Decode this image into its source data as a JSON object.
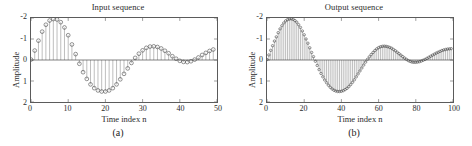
{
  "figure": {
    "background": "#ffffff",
    "line_color": "#7a7a7a",
    "marker_color": "#3a3a3a",
    "axis_color": "#5b5b5b"
  },
  "panels": [
    {
      "id": "a",
      "sublabel": "(a)",
      "title": "Input sequence",
      "xlabel": "Time index n",
      "ylabel": "Amplitude",
      "xticks": [
        "0",
        "10",
        "20",
        "30",
        "40",
        "50"
      ],
      "yticks": [
        "2",
        "1",
        "0",
        "-1",
        "-2"
      ]
    },
    {
      "id": "b",
      "sublabel": "(b)",
      "title": "Output sequence",
      "xlabel": "Time index n",
      "ylabel": "Amplitude",
      "xticks": [
        "0",
        "20",
        "40",
        "60",
        "80",
        "100"
      ],
      "yticks": [
        "2",
        "1",
        "0",
        "-1",
        "-2"
      ]
    }
  ],
  "chart_data": [
    {
      "type": "bar",
      "plot_style": "stem",
      "title": "Input sequence",
      "xlabel": "Time index n",
      "ylabel": "Amplitude",
      "xlim": [
        0,
        50
      ],
      "ylim": [
        -2,
        2
      ],
      "xticks": [
        0,
        10,
        20,
        30,
        40,
        50
      ],
      "yticks": [
        -2,
        -1,
        0,
        1,
        2
      ],
      "grid": false,
      "legend": null,
      "marker": "open-circle",
      "x": [
        0,
        1,
        2,
        3,
        4,
        5,
        6,
        7,
        8,
        9,
        10,
        11,
        12,
        13,
        14,
        15,
        16,
        17,
        18,
        19,
        20,
        21,
        22,
        23,
        24,
        25,
        26,
        27,
        28,
        29,
        30,
        31,
        32,
        33,
        34,
        35,
        36,
        37,
        38,
        39,
        40,
        41,
        42,
        43,
        44,
        45,
        46,
        47,
        48,
        49
      ],
      "values": [
        0.02,
        0.45,
        0.92,
        1.35,
        1.68,
        1.88,
        1.95,
        1.93,
        1.8,
        1.55,
        1.18,
        0.74,
        0.28,
        -0.18,
        -0.58,
        -0.9,
        -1.16,
        -1.34,
        -1.45,
        -1.5,
        -1.5,
        -1.45,
        -1.34,
        -1.16,
        -0.92,
        -0.66,
        -0.4,
        -0.14,
        0.1,
        0.3,
        0.46,
        0.58,
        0.64,
        0.65,
        0.62,
        0.55,
        0.44,
        0.32,
        0.18,
        0.06,
        -0.04,
        -0.09,
        -0.1,
        -0.06,
        0.02,
        0.12,
        0.24,
        0.34,
        0.43,
        0.5
      ]
    },
    {
      "type": "bar",
      "plot_style": "stem",
      "title": "Output sequence",
      "xlabel": "Time index n",
      "ylabel": "Amplitude",
      "xlim": [
        0,
        100
      ],
      "ylim": [
        -2,
        2
      ],
      "xticks": [
        0,
        20,
        40,
        60,
        80,
        100
      ],
      "yticks": [
        -2,
        -1,
        0,
        1,
        2
      ],
      "grid": false,
      "legend": null,
      "marker": "open-circle",
      "x": [
        0,
        1,
        2,
        3,
        4,
        5,
        6,
        7,
        8,
        9,
        10,
        11,
        12,
        13,
        14,
        15,
        16,
        17,
        18,
        19,
        20,
        21,
        22,
        23,
        24,
        25,
        26,
        27,
        28,
        29,
        30,
        31,
        32,
        33,
        34,
        35,
        36,
        37,
        38,
        39,
        40,
        41,
        42,
        43,
        44,
        45,
        46,
        47,
        48,
        49,
        50,
        51,
        52,
        53,
        54,
        55,
        56,
        57,
        58,
        59,
        60,
        61,
        62,
        63,
        64,
        65,
        66,
        67,
        68,
        69,
        70,
        71,
        72,
        73,
        74,
        75,
        76,
        77,
        78,
        79,
        80,
        81,
        82,
        83,
        84,
        85,
        86,
        87,
        88,
        89,
        90,
        91,
        92,
        93,
        94,
        95,
        96,
        97,
        98,
        99
      ],
      "values": [
        0.02,
        0.24,
        0.46,
        0.68,
        0.9,
        1.1,
        1.3,
        1.48,
        1.63,
        1.76,
        1.86,
        1.92,
        1.95,
        1.96,
        1.94,
        1.88,
        1.8,
        1.68,
        1.55,
        1.38,
        1.2,
        1.0,
        0.8,
        0.58,
        0.36,
        0.16,
        -0.06,
        -0.26,
        -0.46,
        -0.64,
        -0.8,
        -0.95,
        -1.08,
        -1.2,
        -1.3,
        -1.38,
        -1.44,
        -1.48,
        -1.5,
        -1.5,
        -1.49,
        -1.46,
        -1.41,
        -1.35,
        -1.27,
        -1.17,
        -1.06,
        -0.94,
        -0.8,
        -0.66,
        -0.52,
        -0.38,
        -0.24,
        -0.1,
        0.03,
        0.15,
        0.26,
        0.36,
        0.45,
        0.53,
        0.59,
        0.63,
        0.65,
        0.66,
        0.65,
        0.63,
        0.6,
        0.56,
        0.5,
        0.44,
        0.37,
        0.3,
        0.23,
        0.16,
        0.09,
        0.03,
        -0.03,
        -0.07,
        -0.1,
        -0.11,
        -0.11,
        -0.1,
        -0.08,
        -0.05,
        -0.01,
        0.03,
        0.08,
        0.13,
        0.18,
        0.23,
        0.28,
        0.33,
        0.37,
        0.41,
        0.45,
        0.48,
        0.5,
        0.52,
        0.53,
        0.54,
        0.54
      ]
    }
  ]
}
